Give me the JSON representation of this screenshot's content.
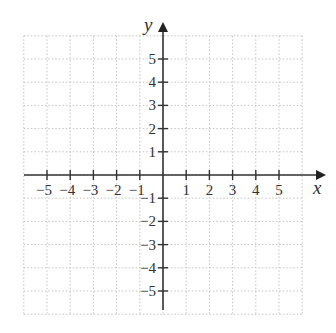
{
  "diagram": {
    "type": "coordinate-plane",
    "x_axis_label": "x",
    "y_axis_label": "y",
    "x_range": [
      -6,
      6
    ],
    "y_range": [
      -6,
      6
    ],
    "x_tick_labels": [
      "−5",
      "−4",
      "−3",
      "−2",
      "−1",
      "1",
      "2",
      "3",
      "4",
      "5"
    ],
    "y_tick_labels": [
      "5",
      "4",
      "3",
      "2",
      "1",
      "−1",
      "−2",
      "−3",
      "−4",
      "−5"
    ],
    "grid": "dotted",
    "colors": {
      "axis": "#333333",
      "grid": "#bbbbbb",
      "background": "#ffffff"
    }
  }
}
